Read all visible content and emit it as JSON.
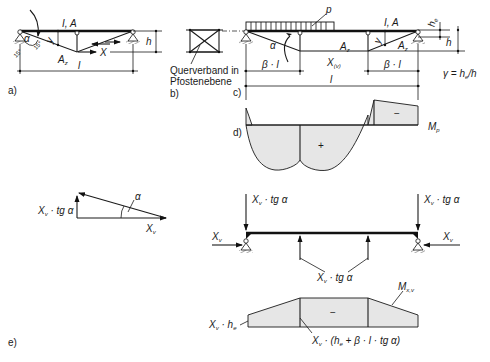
{
  "panels": {
    "a": {
      "tag": "a)",
      "beam_label": "I, A",
      "chord_label": "A_z",
      "chord_label_main": "A",
      "chord_label_sub": "z",
      "x_label": "X",
      "span_label": "l",
      "height_label": "h",
      "y_label": "y",
      "angle_labels": [
        "α",
        "15°",
        "15°"
      ]
    },
    "b": {
      "tag": "b)",
      "caption_line1": "Querverband in",
      "caption_line2": "Pfostenebene"
    },
    "c": {
      "tag": "c)",
      "load_label": "p",
      "beam_label": "I, A",
      "chord_label_main": "A",
      "chord_label_sub": "z",
      "alpha_label": "α",
      "beta_left": "β · l",
      "beta_right": "β · l",
      "x_label_main": "X",
      "x_label_sub": "(v)",
      "span_label": "l",
      "he_main": "h",
      "he_sub": "e",
      "h_label": "h",
      "y_label": "y",
      "gamma_formula": "γ = h",
      "gamma_sub": "e",
      "gamma_tail": "/h"
    },
    "d": {
      "tag": "d)",
      "plus": "+",
      "minus": "−",
      "moment_main": "M",
      "moment_sub": "p"
    },
    "e": {
      "tag": "e)",
      "triangle_vertical": "X",
      "triangle_vertical_sub": "v",
      "triangle_vertical_tail": " · tg α",
      "triangle_horizontal": "X",
      "triangle_horizontal_sub": "v",
      "triangle_angle": "α",
      "load_left_main": "X",
      "load_left_sub": "v",
      "load_left_tail": " · tg α",
      "load_right_main": "X",
      "load_right_sub": "v",
      "load_right_tail": " · tg α",
      "axial_left_main": "X",
      "axial_left_sub": "v",
      "axial_right_main": "X",
      "axial_right_sub": "v",
      "post_force_main": "X",
      "post_force_sub": "v",
      "post_force_tail": " · tg α",
      "moment_main": "M",
      "moment_sub": "x,v",
      "minus": "−",
      "end_moment_main": "X",
      "end_moment_sub": "v",
      "end_moment_tail": " · h",
      "end_moment_tail_sub": "e",
      "mid_moment_main": "X",
      "mid_moment_sub": "v",
      "mid_moment_tail": " · (h",
      "mid_moment_tail_sub": "e",
      "mid_moment_end": " + β · l · tg α)"
    }
  },
  "colors": {
    "ink": "#1a1a1a",
    "fill": "#e6e6e6",
    "background": "#ffffff"
  }
}
